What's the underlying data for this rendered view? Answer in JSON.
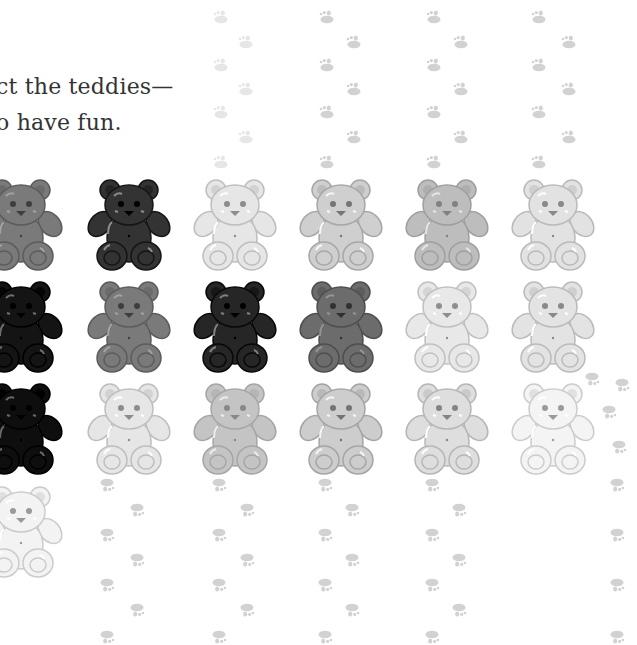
{
  "text": {
    "line1": "ct the teddies—",
    "line2": "o have fun."
  },
  "colors": {
    "text": "#333333",
    "paw": "#d2d2d2",
    "paw_faint": "#e6e6e6"
  },
  "bears": {
    "rows": [
      [
        "#7a7a7a",
        "#333333",
        "#e6e6e6",
        "#cfcfcf",
        "#bdbdbd",
        "#e2e2e2"
      ],
      [
        "#141414",
        "#7a7a7a",
        "#262626",
        "#6c6c6c",
        "#e8e8e8",
        "#e3e3e3"
      ],
      [
        "#0e0e0e",
        "#e6e6e6",
        "#c4c4c4",
        "#cdcdcd",
        "#dedede",
        "#f4f4f4"
      ],
      [
        "#f3f3f3",
        null,
        null,
        null,
        null,
        null
      ]
    ],
    "column_x": [
      -22,
      86,
      192,
      298,
      404,
      510
    ],
    "row_y": [
      178,
      280,
      382,
      485
    ],
    "count_visible": 19
  },
  "paw_trails": {
    "top_columns": [
      [
        212,
        237
      ],
      [
        318,
        345
      ],
      [
        425,
        452
      ],
      [
        530,
        560
      ]
    ],
    "top_rows": [
      10,
      35,
      58,
      82,
      105,
      130,
      155
    ],
    "bottom_columns": [
      [
        100,
        130
      ],
      [
        212,
        240
      ],
      [
        318,
        345
      ],
      [
        425,
        452
      ],
      [
        610,
        620
      ]
    ],
    "bottom_rows": [
      478,
      503,
      528,
      553,
      578,
      603,
      630
    ]
  }
}
